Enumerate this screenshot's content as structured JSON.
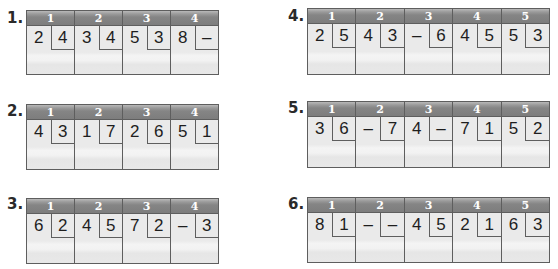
{
  "problems": [
    {
      "label": "1.",
      "columns": [
        {
          "header": "1",
          "left": "2",
          "right": "4"
        },
        {
          "header": "2",
          "left": "3",
          "right": "4"
        },
        {
          "header": "3",
          "left": "5",
          "right": "3"
        },
        {
          "header": "4",
          "left": "8",
          "right": "–"
        }
      ]
    },
    {
      "label": "2.",
      "columns": [
        {
          "header": "1",
          "left": "4",
          "right": "3"
        },
        {
          "header": "2",
          "left": "1",
          "right": "7"
        },
        {
          "header": "3",
          "left": "2",
          "right": "6"
        },
        {
          "header": "4",
          "left": "5",
          "right": "1"
        }
      ]
    },
    {
      "label": "3.",
      "columns": [
        {
          "header": "1",
          "left": "6",
          "right": "2"
        },
        {
          "header": "2",
          "left": "4",
          "right": "5"
        },
        {
          "header": "3",
          "left": "7",
          "right": "2"
        },
        {
          "header": "4",
          "left": "–",
          "right": "3"
        }
      ]
    },
    {
      "label": "4.",
      "columns": [
        {
          "header": "1",
          "left": "2",
          "right": "5"
        },
        {
          "header": "2",
          "left": "4",
          "right": "3"
        },
        {
          "header": "3",
          "left": "–",
          "right": "6"
        },
        {
          "header": "4",
          "left": "4",
          "right": "5"
        },
        {
          "header": "5",
          "left": "5",
          "right": "3"
        }
      ]
    },
    {
      "label": "5.",
      "columns": [
        {
          "header": "1",
          "left": "3",
          "right": "6"
        },
        {
          "header": "2",
          "left": "–",
          "right": "7"
        },
        {
          "header": "3",
          "left": "4",
          "right": "–"
        },
        {
          "header": "4",
          "left": "7",
          "right": "1"
        },
        {
          "header": "5",
          "left": "5",
          "right": "2"
        }
      ]
    },
    {
      "label": "6.",
      "columns": [
        {
          "header": "1",
          "left": "8",
          "right": "1"
        },
        {
          "header": "2",
          "left": "–",
          "right": "–"
        },
        {
          "header": "3",
          "left": "4",
          "right": "5"
        },
        {
          "header": "4",
          "left": "2",
          "right": "1"
        },
        {
          "header": "5",
          "left": "6",
          "right": "3"
        }
      ]
    }
  ]
}
